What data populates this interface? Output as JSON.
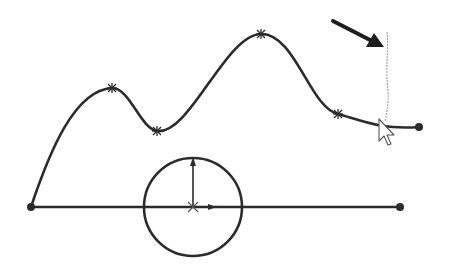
{
  "canvas": {
    "width": 452,
    "height": 266,
    "background": "#ffffff"
  },
  "colors": {
    "stroke": "#2b2b2b",
    "guide": "#9a9a9a",
    "cursor_fill": "#ffffff",
    "cursor_stroke": "#555555"
  },
  "sketch": {
    "spline": {
      "start": [
        31,
        207
      ],
      "through_points": [
        [
          112,
          88
        ],
        [
          157,
          131
        ],
        [
          261,
          34
        ],
        [
          338,
          114
        ]
      ],
      "end": [
        419,
        127
      ]
    },
    "horizontal_line": {
      "start": [
        31,
        207
      ],
      "end": [
        400,
        207
      ]
    },
    "circle": {
      "center": [
        193,
        207
      ],
      "radius": 49
    },
    "axis_arrows": {
      "origin": [
        193,
        207
      ],
      "up_end": [
        193,
        158
      ],
      "right_end": [
        216,
        207
      ]
    },
    "guide_line": {
      "x": 387,
      "y_top": 32,
      "y_bottom": 122
    },
    "pointer_arrow": {
      "from": [
        333,
        21
      ],
      "to": [
        383,
        46
      ]
    },
    "cursor": {
      "tip": [
        379,
        119
      ]
    }
  }
}
